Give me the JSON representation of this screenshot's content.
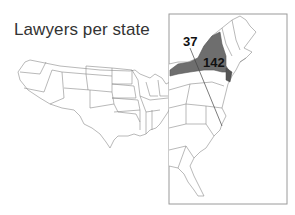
{
  "title": "Lawyers per state",
  "colors": {
    "highlight": "#707070",
    "highlight_secondary": "#555555",
    "outline": "#8a8a8a",
    "frame": "#9a9a9a",
    "text": "#333333",
    "label": "#111111"
  },
  "inset": {
    "name": "northeast-inset-frame"
  },
  "callouts": [
    {
      "value": "37",
      "state_hint": "mid-atlantic (leader line)"
    },
    {
      "value": "142",
      "state_hint": "New York (shaded)"
    }
  ],
  "labels": {
    "callout_37": "37",
    "callout_142": "142"
  }
}
